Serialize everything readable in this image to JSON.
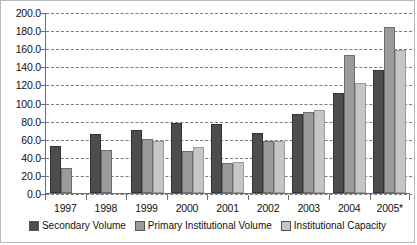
{
  "chart_data": {
    "type": "bar",
    "title": "",
    "subtitle": "",
    "xlabel": "",
    "ylabel": "",
    "ylim": [
      0.0,
      200.0
    ],
    "ytick_labels": [
      "200.0",
      "180.0",
      "160.0",
      "140.0",
      "120.0",
      "100.0",
      "80.0",
      "60.0",
      "40.0",
      "20.0",
      "0.0"
    ],
    "ytick_values": [
      200,
      180,
      160,
      140,
      120,
      100,
      80,
      60,
      40,
      20,
      0
    ],
    "grid": true,
    "legend_position": "bottom",
    "categories": [
      "1997",
      "1998",
      "1999",
      "2000",
      "2001",
      "2002",
      "2003",
      "2004",
      "2005*"
    ],
    "series": [
      {
        "name": "Secondary Volume",
        "color": "#4d4d4d",
        "values": [
          52,
          65,
          70,
          77,
          76,
          66,
          87,
          110,
          136
        ]
      },
      {
        "name": "Primary Institutional Volume",
        "color": "#9a9a9a",
        "values": [
          28,
          47,
          60,
          46,
          33,
          58,
          90,
          153,
          183
        ]
      },
      {
        "name": "Institutional Capacity",
        "color": "#c6c6c6",
        "values": [
          null,
          null,
          58,
          51,
          34,
          57,
          92,
          122,
          158
        ]
      }
    ]
  }
}
